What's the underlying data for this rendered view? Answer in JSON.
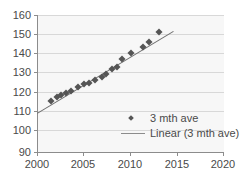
{
  "chart_data": {
    "type": "scatter",
    "title": "",
    "xlabel": "",
    "ylabel": "",
    "xlim": [
      2000,
      2020
    ],
    "ylim": [
      90,
      160
    ],
    "xticks": [
      "2000",
      "2005",
      "2010",
      "2015",
      "2020"
    ],
    "yticks": [
      "90",
      "100",
      "110",
      "120",
      "130",
      "140",
      "150",
      "160"
    ],
    "grid": true,
    "legend_position": "inside-bottom-right",
    "series": [
      {
        "name": "3 mth ave",
        "type": "scatter",
        "marker": "diamond",
        "color": "#555555",
        "x": [
          2001.5,
          2002.1,
          2002.6,
          2003.1,
          2003.6,
          2004.4,
          2005.0,
          2005.6,
          2006.2,
          2006.9,
          2007.4,
          2008.0,
          2008.6,
          2009.1,
          2010.1,
          2011.3,
          2012.0,
          2013.0
        ],
        "y": [
          116.3,
          118.0,
          119.2,
          120.0,
          121.0,
          123.3,
          124.5,
          125.3,
          127.0,
          128.3,
          129.6,
          132.2,
          133.6,
          137.6,
          140.7,
          143.8,
          146.2,
          151.2
        ]
      },
      {
        "name": "Linear (3 mth ave)",
        "type": "line",
        "color": "#6e6e6e",
        "x": [
          2000.0,
          2014.6
        ],
        "y": [
          110.0,
          152.0
        ]
      }
    ],
    "legend": [
      {
        "label": "3 mth ave",
        "marker": "diamond",
        "color": "#555555"
      },
      {
        "label": "Linear (3 mth ave)",
        "marker": "line",
        "color": "#8c8c8c"
      }
    ]
  },
  "colors": {
    "marker": "#555555",
    "trendline": "#6e6e6e",
    "grid": "#d8d8d8",
    "axis": "#8c8c8c",
    "plot_background": "#f7f7f7",
    "text": "#4a4a4a"
  }
}
